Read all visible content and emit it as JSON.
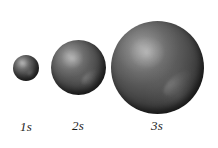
{
  "figure": {
    "caption_context": "Relative sizes of the 1s, 2s and 3s atomic orbitals",
    "background_color": "#ffffff",
    "width_px": 218,
    "height_px": 148
  },
  "orbitals": [
    {
      "id": "1s",
      "principal_quantum_number": "1",
      "subshell": "s",
      "label": "1s",
      "center_x_px": 26,
      "center_y_px": 68,
      "diameter_px": 26,
      "relative_size": 1.0,
      "fill_color": "#4a4a4a",
      "highlight_color": "#c8c8c8"
    },
    {
      "id": "2s",
      "principal_quantum_number": "2",
      "subshell": "s",
      "label": "2s",
      "center_x_px": 78,
      "center_y_px": 67,
      "diameter_px": 55,
      "relative_size": 2.1,
      "fill_color": "#4a4a4a",
      "highlight_color": "#c8c8c8"
    },
    {
      "id": "3s",
      "principal_quantum_number": "3",
      "subshell": "s",
      "label": "3s",
      "center_x_px": 157,
      "center_y_px": 67,
      "diameter_px": 93,
      "relative_size": 3.6,
      "fill_color": "#4a4a4a",
      "highlight_color": "#c8c8c8"
    }
  ]
}
